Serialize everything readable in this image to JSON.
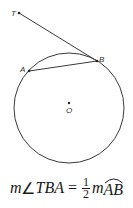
{
  "diagram": {
    "type": "circle-tangent-chord",
    "colors": {
      "stroke": "#3a3a3a",
      "background": "#ffffff",
      "text": "#1a1a1a"
    },
    "circle": {
      "center_label": "O",
      "cx": 69,
      "cy": 108,
      "r": 55
    },
    "points": {
      "T": {
        "label": "T",
        "x": 19,
        "y": 13
      },
      "B": {
        "label": "B",
        "x": 97,
        "y": 61
      },
      "A": {
        "label": "A",
        "x": 29,
        "y": 71
      },
      "O": {
        "label": "O",
        "x": 69,
        "y": 108
      }
    },
    "segments": [
      {
        "name": "tangent-TB",
        "from": "T",
        "to": "B"
      },
      {
        "name": "chord-AB",
        "from": "A",
        "to": "B"
      }
    ]
  },
  "formula": {
    "m1": "m",
    "angle_symbol": "∠",
    "angle_name": "TBA",
    "equals": "=",
    "frac_num": "1",
    "frac_den": "2",
    "m2": "m",
    "arc_name": "AB",
    "full_text": "m∠TBA = ½ m arc AB"
  }
}
